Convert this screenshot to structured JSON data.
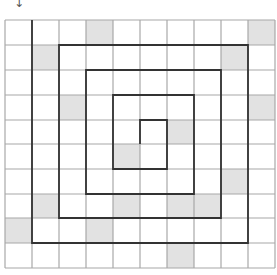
{
  "diagram": {
    "type": "grid-spiral",
    "start_arrow": {
      "glyph": "↓",
      "column": 0
    },
    "grid": {
      "rows": 10,
      "cols": 10,
      "x_lines": [
        5,
        32,
        59,
        86,
        113,
        140,
        167,
        194,
        221,
        248,
        275
      ],
      "y_lines": [
        20,
        45,
        70,
        95,
        120,
        144,
        169,
        194,
        218,
        243,
        268
      ],
      "line_color": "#a8a8a8",
      "background": "#ffffff"
    },
    "shaded_cells": [
      {
        "row": 0,
        "col": 3
      },
      {
        "row": 0,
        "col": 9
      },
      {
        "row": 1,
        "col": 1
      },
      {
        "row": 1,
        "col": 8
      },
      {
        "row": 3,
        "col": 2
      },
      {
        "row": 3,
        "col": 9
      },
      {
        "row": 4,
        "col": 6
      },
      {
        "row": 5,
        "col": 4
      },
      {
        "row": 6,
        "col": 8
      },
      {
        "row": 7,
        "col": 1
      },
      {
        "row": 7,
        "col": 4
      },
      {
        "row": 7,
        "col": 6
      },
      {
        "row": 7,
        "col": 7
      },
      {
        "row": 8,
        "col": 0
      },
      {
        "row": 8,
        "col": 3
      },
      {
        "row": 9,
        "col": 6
      }
    ],
    "shade_color": "#e2e2e2",
    "spiral": {
      "color": "#333333",
      "points": [
        [
          32,
          20
        ],
        [
          32,
          243
        ],
        [
          248,
          243
        ],
        [
          248,
          45
        ],
        [
          59,
          45
        ],
        [
          59,
          218
        ],
        [
          221,
          218
        ],
        [
          221,
          70
        ],
        [
          86,
          70
        ],
        [
          86,
          194
        ],
        [
          194,
          194
        ],
        [
          194,
          95
        ],
        [
          113,
          95
        ],
        [
          113,
          169
        ],
        [
          167,
          169
        ],
        [
          167,
          120
        ],
        [
          140,
          120
        ],
        [
          140,
          144
        ]
      ]
    }
  }
}
